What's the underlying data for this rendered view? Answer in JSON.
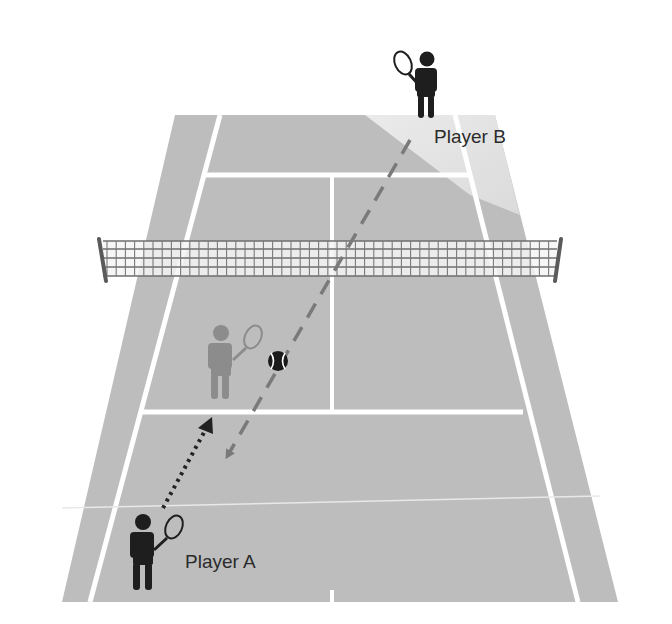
{
  "diagram": {
    "type": "tennis-court-perspective",
    "colors": {
      "background": "#ffffff",
      "court": "#bdbdbd",
      "court_highlight": "#e6e6e6",
      "lines": "#ffffff",
      "net_mesh": "#6e6e6e",
      "net_post": "#5a5a5a",
      "player_active": "#1e1e1e",
      "player_ghost": "#8c8c8c",
      "shot_path": "#7a7a7a",
      "movement_path": "#222222",
      "ball": "#1a1a1a"
    },
    "players": [
      {
        "id": "A",
        "label": "Player A",
        "position": "near baseline, left"
      },
      {
        "id": "B",
        "label": "Player B",
        "position": "far baseline, right"
      }
    ],
    "ghost_player": {
      "description": "Player A destination position near net",
      "position": "near service box, left"
    },
    "ball": {
      "position": "near service box, mid-court"
    },
    "paths": [
      {
        "name": "shot-path",
        "style": "dashed",
        "from": "Player B",
        "to": "near service line area",
        "arrow": "end"
      },
      {
        "name": "movement-path",
        "style": "dotted",
        "from": "Player A",
        "to": "near service line",
        "arrow": "end"
      }
    ]
  }
}
